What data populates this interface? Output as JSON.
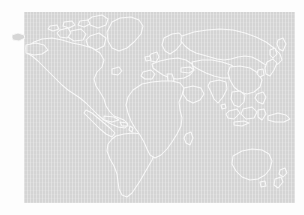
{
  "canvas": {
    "width": 304,
    "height": 215,
    "page_background": "#fdfdfd"
  },
  "map": {
    "title": "World Map",
    "projection": "equirectangular",
    "ocean_fill": "#d4d4d4",
    "land_outline_color": "#f7f7f7",
    "land_fill": "#d4d4d4",
    "outline_width": 1,
    "panel": {
      "x": 24,
      "y": 12,
      "width": 271,
      "height": 191
    },
    "has_labels": false,
    "has_graticule": false,
    "texture": "vertical-dither-stripes",
    "regions": [
      "north-america",
      "greenland",
      "canadian-arctic-islands",
      "central-america",
      "caribbean",
      "south-america",
      "europe",
      "scandinavia",
      "british-isles",
      "mediterranean",
      "africa",
      "madagascar",
      "middle-east",
      "russia-siberia",
      "india",
      "china-east-asia",
      "japan",
      "southeast-asia",
      "indonesia",
      "philippines",
      "new-guinea",
      "australia",
      "new-zealand"
    ]
  }
}
